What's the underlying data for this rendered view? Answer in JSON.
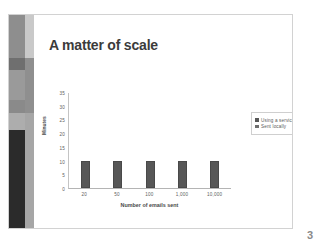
{
  "slide": {
    "title": "A matter of scale",
    "page_number": "3",
    "accent_dark": "#575757",
    "band_segments": [
      {
        "color": "#8e8e8e",
        "height": "20%"
      },
      {
        "color": "#6f6f6f",
        "height": "6%"
      },
      {
        "color": "#9a9a9a",
        "height": "14%"
      },
      {
        "color": "#8a8a8a",
        "height": "6%"
      },
      {
        "color": "#adadad",
        "height": "8%"
      },
      {
        "color": "#2b2b2b",
        "height": "46%"
      }
    ],
    "rail_segments": [
      {
        "color": "#c9c9c9",
        "height": "20%"
      },
      {
        "color": "#8f8f8f",
        "height": "26%"
      },
      {
        "color": "#a6a6a6",
        "height": "54%"
      }
    ]
  },
  "chart_data": {
    "type": "bar",
    "title": "",
    "xlabel": "Number of emails sent",
    "ylabel": "Minutes",
    "categories": [
      "20",
      "50",
      "100",
      "1,000",
      "10,000"
    ],
    "series": [
      {
        "name": "Using a service",
        "color": "#575757",
        "values": [
          10,
          10,
          10,
          10,
          10
        ]
      },
      {
        "name": "Sent locally",
        "color": "#6e6e6e",
        "values": [
          0,
          0,
          0,
          0,
          0
        ]
      }
    ],
    "ylim": [
      0,
      35
    ],
    "yticks": [
      0,
      5,
      10,
      15,
      20,
      25,
      30,
      35
    ],
    "ytick_labels": [
      "0",
      "5",
      "10",
      "15",
      "20",
      "25",
      "30",
      "35"
    ],
    "grid": false,
    "legend_position": "top-right"
  }
}
